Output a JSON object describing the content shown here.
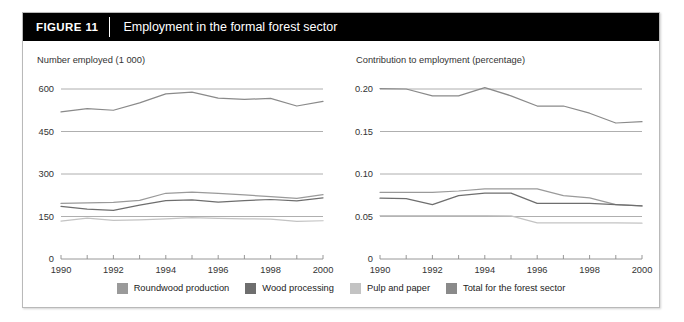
{
  "header": {
    "tag": "FIGURE  11",
    "title": "Employment in the formal forest sector"
  },
  "legend": [
    {
      "label": "Roundwood production",
      "color": "#9a9a9a"
    },
    {
      "label": "Wood processing",
      "color": "#6e6e6e"
    },
    {
      "label": "Pulp and paper",
      "color": "#c3c3c3"
    },
    {
      "label": "Total for the forest sector",
      "color": "#8a8a8a"
    }
  ],
  "chart_data": [
    {
      "type": "line",
      "title": "Number employed (1 000)",
      "xlabel": "",
      "ylabel": "Number employed (1 000)",
      "x": [
        1990,
        1991,
        1992,
        1993,
        1994,
        1995,
        1996,
        1997,
        1998,
        1999,
        2000
      ],
      "xlim": [
        1990,
        2000
      ],
      "ylim": [
        0,
        600
      ],
      "yticks": [
        0,
        150,
        300,
        450,
        600
      ],
      "ytick_labels": [
        "0",
        "150",
        "300",
        "450",
        "600"
      ],
      "xticks": [
        1990,
        1991,
        1992,
        1993,
        1994,
        1995,
        1996,
        1997,
        1998,
        1999,
        2000
      ],
      "xtick_labels": [
        "1990",
        "",
        "1992",
        "",
        "1994",
        "",
        "1996",
        "",
        "1998",
        "",
        "2000"
      ],
      "grid": true,
      "legend_position": "bottom",
      "series": [
        {
          "name": "Roundwood production",
          "color": "#9a9a9a",
          "values": [
            196,
            198,
            200,
            207,
            232,
            236,
            232,
            226,
            220,
            214,
            227
          ]
        },
        {
          "name": "Wood processing",
          "color": "#6e6e6e",
          "values": [
            186,
            176,
            172,
            190,
            206,
            209,
            201,
            206,
            210,
            205,
            216
          ]
        },
        {
          "name": "Pulp and paper",
          "color": "#c3c3c3",
          "values": [
            134,
            144,
            136,
            138,
            142,
            146,
            143,
            142,
            141,
            133,
            135
          ]
        },
        {
          "name": "Total for the forest sector",
          "color": "#8a8a8a",
          "values": [
            519,
            531,
            525,
            551,
            583,
            589,
            568,
            563,
            567,
            540,
            556
          ]
        }
      ]
    },
    {
      "type": "line",
      "title": "Contribution to employment (percentage)",
      "xlabel": "",
      "ylabel": "Contribution to employment (percentage)",
      "x": [
        1990,
        1991,
        1992,
        1993,
        1994,
        1995,
        1996,
        1997,
        1998,
        1999,
        2000
      ],
      "xlim": [
        1990,
        2000
      ],
      "ylim": [
        0,
        0.2
      ],
      "yticks": [
        0,
        0.05,
        0.1,
        0.15,
        0.2
      ],
      "ytick_labels": [
        "0",
        "0.05",
        "0.10",
        "0.15",
        "0.20"
      ],
      "xticks": [
        1990,
        1991,
        1992,
        1993,
        1994,
        1995,
        1996,
        1997,
        1998,
        1999,
        2000
      ],
      "xtick_labels": [
        "1990",
        "",
        "1992",
        "",
        "1994",
        "",
        "1996",
        "",
        "1998",
        "",
        "2000"
      ],
      "grid": true,
      "legend_position": "bottom",
      "series": [
        {
          "name": "Roundwood production",
          "color": "#9a9a9a",
          "values": [
            0.0785,
            0.0785,
            0.0785,
            0.08,
            0.0825,
            0.0825,
            0.0825,
            0.0745,
            0.072,
            0.064,
            0.0625
          ]
        },
        {
          "name": "Wood processing",
          "color": "#6e6e6e",
          "values": [
            0.0715,
            0.071,
            0.064,
            0.0745,
            0.0775,
            0.0775,
            0.0655,
            0.0655,
            0.0655,
            0.064,
            0.0625
          ]
        },
        {
          "name": "Pulp and paper",
          "color": "#c3c3c3",
          "values": [
            0.051,
            0.051,
            0.051,
            0.051,
            0.051,
            0.0508,
            0.0425,
            0.0425,
            0.0425,
            0.0425,
            0.0422
          ]
        },
        {
          "name": "Total for the forest sector",
          "color": "#8a8a8a",
          "values": [
            0.2005,
            0.2,
            0.192,
            0.192,
            0.2015,
            0.192,
            0.18,
            0.18,
            0.1715,
            0.16,
            0.1615
          ]
        }
      ]
    }
  ]
}
